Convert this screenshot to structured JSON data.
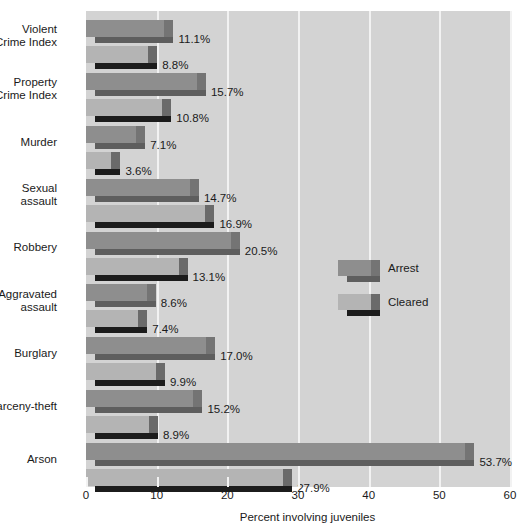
{
  "chart_data": {
    "type": "bar",
    "orientation": "horizontal",
    "title": "",
    "subtitle": "",
    "xlabel": "Percent involving juveniles",
    "ylabel": "",
    "xlim": [
      0,
      60
    ],
    "xticks": [
      0,
      10,
      20,
      30,
      40,
      50,
      60
    ],
    "xtick_labels": [
      "0",
      "10",
      "20",
      "30",
      "40",
      "50",
      "60"
    ],
    "grid": true,
    "grid_axis": "x",
    "legend_position": "center-right",
    "categories": [
      "Violent\nCrime Index",
      "Property\nCrime Index",
      "Murder",
      "Sexual\nassault",
      "Robbery",
      "Aggravated\nassault",
      "Burglary",
      "Larceny-theft",
      "Arson"
    ],
    "series": [
      {
        "name": "Arrest",
        "color": "#8e8e8e",
        "values": [
          11.1,
          15.7,
          7.1,
          14.7,
          20.5,
          8.6,
          17.0,
          15.2,
          53.7
        ],
        "labels": [
          "11.1%",
          "15.7%",
          "7.1%",
          "14.7%",
          "20.5%",
          "8.6%",
          "17.0%",
          "15.2%",
          "53.7%"
        ]
      },
      {
        "name": "Cleared",
        "color": "#b4b4b4",
        "values": [
          8.8,
          10.8,
          3.6,
          16.9,
          13.1,
          7.4,
          9.9,
          8.9,
          27.9
        ],
        "labels": [
          "8.8%",
          "10.8%",
          "3.6%",
          "16.9%",
          "13.1%",
          "7.4%",
          "9.9%",
          "8.9%",
          "27.9%"
        ]
      }
    ]
  },
  "axis": {
    "x_title": "Percent involving juveniles",
    "ticks": [
      "0",
      "10",
      "20",
      "30",
      "40",
      "50",
      "60"
    ]
  },
  "legend": {
    "items": [
      {
        "label": "Arrest"
      },
      {
        "label": "Cleared"
      }
    ]
  },
  "categories": [
    {
      "label": "Violent\nCrime Index"
    },
    {
      "label": "Property\nCrime Index"
    },
    {
      "label": "Murder"
    },
    {
      "label": "Sexual\nassault"
    },
    {
      "label": "Robbery"
    },
    {
      "label": "Aggravated\nassault"
    },
    {
      "label": "Burglary"
    },
    {
      "label": "Larceny-theft"
    },
    {
      "label": "Arson"
    }
  ],
  "colors": {
    "plot_background": "#d3d3d3",
    "page_background": "#ffffff",
    "gridline": "#f2f2f2",
    "arrest_face": "#8e8e8e",
    "arrest_bevel": "#5e5e5e",
    "cleared_face": "#b4b4b4",
    "cleared_bevel": "#1c1c1c",
    "text": "#1a1a1a"
  }
}
